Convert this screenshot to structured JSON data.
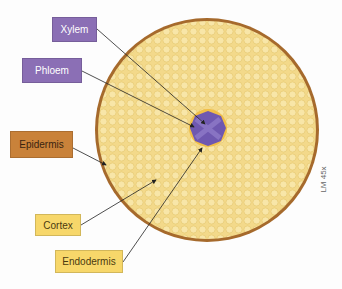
{
  "diagram": {
    "labels": {
      "xylem": "Xylem",
      "phloem": "Phloem",
      "epidermis": "Epidermis",
      "cortex": "Cortex",
      "endodermis": "Endodermis"
    },
    "magnification": "LM 45x",
    "colors": {
      "cortex": "#f3d98a",
      "epidermis": "#a66a2c",
      "stele": "#6f58b0",
      "endodermis_ring": "#f0b93a",
      "label_purple": "#8b6fb5",
      "label_brown": "#c9823a",
      "label_yellow": "#f7d76a"
    }
  }
}
